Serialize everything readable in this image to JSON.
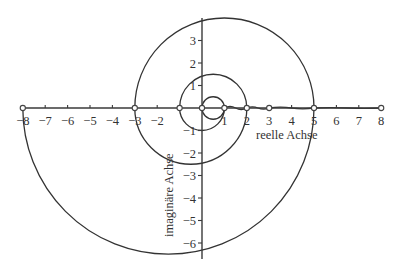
{
  "diagram": {
    "title": "",
    "origin_px": [
      202,
      108
    ],
    "scale_px_per_unit": [
      22.4,
      22.5
    ],
    "x_axis": {
      "label": "reelle Achse",
      "range": [
        -8,
        8
      ],
      "ticks": [
        -8,
        -7,
        -6,
        -5,
        -4,
        -3,
        -2,
        1,
        2,
        3,
        4,
        5,
        6,
        7,
        8
      ],
      "tick_labels": [
        "−8",
        "−7",
        "−6",
        "−5",
        "−4",
        "−3",
        "−2",
        "1",
        "2",
        "3",
        "4",
        "5",
        "6",
        "7",
        "8"
      ]
    },
    "y_axis": {
      "label": "imaginäre Achse",
      "range": [
        -6.6,
        4
      ],
      "ticks": [
        3,
        2,
        1,
        -1,
        -2,
        -3,
        -4,
        -5,
        -6
      ],
      "tick_labels": [
        "3",
        "2",
        "1",
        "−1",
        "−2",
        "−3",
        "−4",
        "−5",
        "−6"
      ]
    },
    "marked_points_on_real_axis": [
      -8,
      -3,
      -1,
      0,
      1,
      2,
      3,
      5,
      8
    ],
    "spiral_semicircles": [
      {
        "from": -8,
        "to": 5,
        "side": "below"
      },
      {
        "from": 5,
        "to": -3,
        "side": "above"
      },
      {
        "from": -3,
        "to": 2,
        "side": "below"
      },
      {
        "from": 2,
        "to": -1,
        "side": "above"
      },
      {
        "from": -1,
        "to": 1,
        "side": "below"
      },
      {
        "from": 1,
        "to": 0,
        "side": "above"
      },
      {
        "from": 0,
        "to": 1,
        "side": "below"
      }
    ],
    "axis_wiggles": [
      {
        "from": 1,
        "to": 2
      },
      {
        "from": 2,
        "to": 3
      },
      {
        "from": 3,
        "to": 5
      },
      {
        "from": 5,
        "to": 8
      }
    ],
    "colors": {
      "line": "#333333",
      "background": "#ffffff"
    }
  }
}
